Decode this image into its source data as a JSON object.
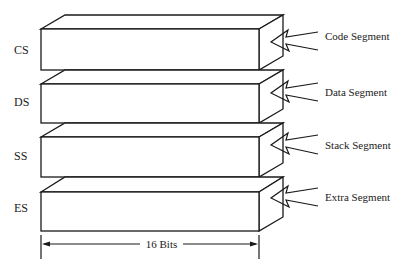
{
  "diagram": {
    "segments": [
      {
        "register": "CS",
        "label": "Code Segment"
      },
      {
        "register": "DS",
        "label": "Data Segment"
      },
      {
        "register": "SS",
        "label": "Stack Segment"
      },
      {
        "register": "ES",
        "label": "Extra Segment"
      }
    ],
    "width_label": "16 Bits",
    "colors": {
      "stroke": "#1a1a1a",
      "background": "#ffffff"
    }
  }
}
